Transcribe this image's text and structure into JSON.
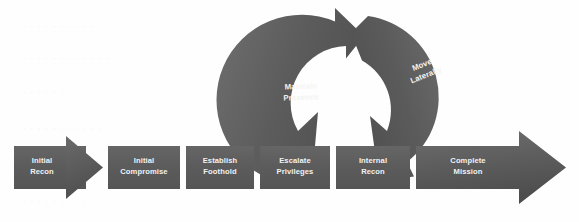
{
  "diagram": {
    "type": "process-flow-with-cycle",
    "background_color": "#fefefe",
    "shape_fill_dark": "#5b5b5b",
    "shape_fill_light": "#6e6e6e",
    "label_color": "#f2f2f2",
    "linear_flow": {
      "name": "attack-stage-sequence",
      "stages": [
        {
          "id": "initial-recon",
          "label_line1": "Initial",
          "label_line2": "Recon"
        },
        {
          "id": "initial-compromise",
          "label_line1": "Initial",
          "label_line2": "Compromise"
        },
        {
          "id": "establish-foothold",
          "label_line1": "Establish",
          "label_line2": "Foothold"
        },
        {
          "id": "escalate-privileges",
          "label_line1": "Escalate",
          "label_line2": "Privileges"
        },
        {
          "id": "internal-recon",
          "label_line1": "Internal",
          "label_line2": "Recon"
        },
        {
          "id": "complete-mission",
          "label_line1": "Complete",
          "label_line2": "Mission"
        }
      ]
    },
    "cycle": {
      "name": "persistence-loop",
      "stages": [
        {
          "id": "maintain-presence",
          "label_line1": "Maintain",
          "label_line2": "Presence"
        },
        {
          "id": "move-laterally",
          "label_line1": "Move",
          "label_line2": "Laterally"
        }
      ]
    }
  }
}
